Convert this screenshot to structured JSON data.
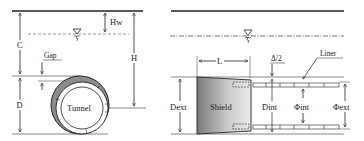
{
  "colors": {
    "line": "#222222",
    "thin_line": "#333333",
    "shield_dark": "#7a7a7a",
    "shield_light": "#e6e6e6",
    "shell_fill": "#8c8c8c",
    "background": "#ffffff"
  },
  "cross_section": {
    "labels": {
      "hw": "Hw",
      "c": "C",
      "h": "H",
      "gap": "Gap",
      "d": "D",
      "tunnel": "Tunnel"
    },
    "icons": [
      "water-table-icon"
    ]
  },
  "longitudinal_section": {
    "labels": {
      "l": "L",
      "delta_half": "Δ/2",
      "liner": "Liner",
      "dext": "Dext",
      "shield": "Shield",
      "dint": "Dint",
      "phi_int": "Φint",
      "phi_ext": "Φext"
    },
    "icons": [
      "water-table-icon"
    ]
  }
}
